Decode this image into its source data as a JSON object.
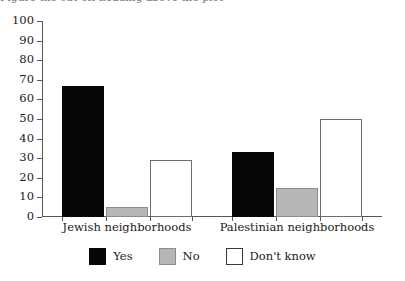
{
  "chart_data": {
    "type": "bar",
    "title": "",
    "xlabel": "",
    "ylabel": "",
    "ylim": [
      0,
      100
    ],
    "ytick_step": 10,
    "yticks": [
      "100",
      "90",
      "80",
      "70",
      "60",
      "50",
      "40",
      "30",
      "20",
      "10",
      "0"
    ],
    "grid": false,
    "legend_position": "bottom-center",
    "categories": [
      "Jewish neighborhoods",
      "Palestinian neighborhoods"
    ],
    "series": [
      {
        "name": "Yes",
        "color": "#070707",
        "values": [
          67,
          33
        ]
      },
      {
        "name": "No",
        "color": "#b6b6b6",
        "values": [
          5,
          15
        ]
      },
      {
        "name": "Don't know",
        "color": "#ffffff",
        "values": [
          29,
          50
        ]
      }
    ]
  },
  "legend": {
    "items": [
      {
        "label": "Yes",
        "swatch": "black-swatch"
      },
      {
        "label": "No",
        "swatch": "gray-swatch"
      },
      {
        "label": "Don't know",
        "swatch": "white-swatch"
      }
    ]
  },
  "title_remnant": "Figure  the cut-off heading above the plot"
}
